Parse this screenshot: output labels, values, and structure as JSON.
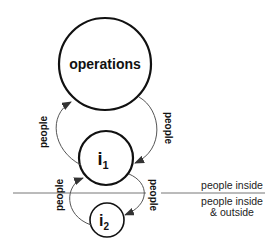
{
  "nodes": {
    "operations": {
      "label": "operations"
    },
    "i1": {
      "label": "i",
      "sub": "1"
    },
    "i2": {
      "label": "i",
      "sub": "2"
    }
  },
  "edges": {
    "i1_to_operations": {
      "label": "people"
    },
    "operations_to_i1": {
      "label": "people"
    },
    "i2_to_i1": {
      "label": "people"
    },
    "i1_to_i2": {
      "label": "people"
    }
  },
  "zones": {
    "upper": "people inside",
    "lower_line1": "people inside",
    "lower_line2": "& outside"
  },
  "colors": {
    "stroke": "#111111",
    "edge": "#555555",
    "divider": "#777777"
  }
}
